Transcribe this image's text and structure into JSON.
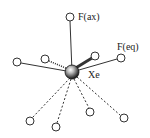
{
  "diagram": {
    "center": {
      "label": "Xe",
      "x": 72,
      "y": 72,
      "r": 7
    },
    "labels": {
      "axial": "F(ax)",
      "equatorial": "F(eq)",
      "center": "Xe"
    },
    "atoms": [
      {
        "id": "f-ax",
        "x": 70,
        "y": 17,
        "bond": "solid",
        "label": "F(ax)"
      },
      {
        "id": "f-eq",
        "x": 121,
        "y": 58,
        "bond": "solid",
        "label": "F(eq)"
      },
      {
        "id": "left-far",
        "x": 17,
        "y": 62,
        "bond": "solid"
      },
      {
        "id": "left-near",
        "x": 45,
        "y": 59,
        "bond": "dotted"
      },
      {
        "id": "right-near",
        "x": 95,
        "y": 56,
        "bond": "wedge"
      },
      {
        "id": "bottom-1",
        "x": 30,
        "y": 121,
        "bond": "dashed"
      },
      {
        "id": "bottom-2",
        "x": 56,
        "y": 127,
        "bond": "dashed"
      },
      {
        "id": "bottom-3",
        "x": 90,
        "y": 112,
        "bond": "dashed"
      },
      {
        "id": "bottom-4",
        "x": 124,
        "y": 118,
        "bond": "dashed"
      }
    ],
    "colors": {
      "stroke": "#333333",
      "atom_fill": "#ffffff"
    }
  }
}
